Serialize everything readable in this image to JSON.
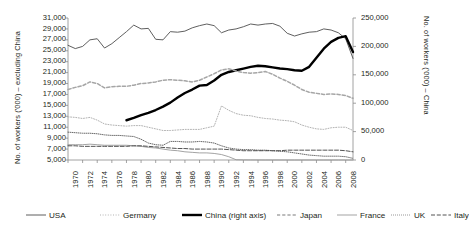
{
  "chart_data": {
    "type": "line",
    "title": "",
    "subtitle": "",
    "xlabel": "",
    "ylabel": "No. of workers ('000) – excluding China",
    "y2label": "No. of workers ('000) – China",
    "grid": false,
    "legend_position": "bottom",
    "x": [
      1970,
      1971,
      1972,
      1973,
      1974,
      1975,
      1976,
      1977,
      1978,
      1979,
      1980,
      1981,
      1982,
      1983,
      1984,
      1985,
      1986,
      1987,
      1988,
      1989,
      1990,
      1991,
      1992,
      1993,
      1994,
      1995,
      1996,
      1997,
      1998,
      1999,
      2000,
      2001,
      2002,
      2003,
      2004,
      2005,
      2006,
      2007,
      2008,
      2009
    ],
    "x_tick_labels": [
      "1970",
      "1972",
      "1974",
      "1976",
      "1978",
      "1980",
      "1982",
      "1984",
      "1986",
      "1988",
      "1990",
      "1992",
      "1994",
      "1996",
      "1998",
      "2000",
      "2002",
      "2004",
      "2006",
      "2008"
    ],
    "xlim": [
      1970,
      2009
    ],
    "ylim": [
      5000,
      31000
    ],
    "y_ticks": [
      5000,
      7000,
      9000,
      11000,
      13000,
      15000,
      17000,
      19000,
      21000,
      23000,
      25000,
      27000,
      29000,
      31000
    ],
    "y_tick_labels": [
      "5,000",
      "7,000",
      "9,000",
      "11,000",
      "13,000",
      "15,000",
      "17,000",
      "19,000",
      "21,000",
      "23,000",
      "25,000",
      "27,000",
      "29,000",
      "31,000"
    ],
    "y2lim": [
      0,
      250000
    ],
    "y2_ticks": [
      0,
      50000,
      100000,
      150000,
      200000,
      250000
    ],
    "y2_tick_labels": [
      "0",
      "50,000",
      "100,000",
      "150,000",
      "200,000",
      "250,000"
    ],
    "series": [
      {
        "name": "USA",
        "axis": "left",
        "style": "solid",
        "color": "#4d4d4d",
        "width": 0.9,
        "values": [
          26000,
          25400,
          25800,
          27000,
          27200,
          25500,
          26300,
          27400,
          28500,
          29700,
          29000,
          29100,
          27100,
          27000,
          28500,
          28400,
          28600,
          29200,
          29600,
          29900,
          29600,
          28300,
          28800,
          29000,
          29400,
          29900,
          29700,
          29900,
          30000,
          29500,
          28200,
          27700,
          28100,
          28400,
          28500,
          29000,
          28800,
          28300,
          27200,
          23600
        ]
      },
      {
        "name": "Germany",
        "axis": "left",
        "style": "dotted",
        "color": "#b3b3b3",
        "width": 1.0,
        "values": [
          12900,
          12800,
          12600,
          12800,
          12300,
          11600,
          11400,
          11300,
          11200,
          11300,
          11300,
          11000,
          10700,
          10400,
          10400,
          10500,
          10600,
          10600,
          10600,
          10900,
          11200,
          14900,
          14100,
          13500,
          13200,
          13100,
          12800,
          12600,
          12500,
          12300,
          12200,
          12000,
          11400,
          11000,
          10700,
          10600,
          10900,
          11000,
          11000,
          10400
        ]
      },
      {
        "name": "China (right axis)",
        "axis": "right",
        "style": "solid",
        "color": "#000000",
        "width": 2.4,
        "values": [
          null,
          null,
          null,
          null,
          null,
          null,
          null,
          null,
          70000,
          74000,
          79000,
          83000,
          88000,
          94000,
          101000,
          110000,
          118000,
          124000,
          131000,
          132000,
          140000,
          150000,
          155000,
          158000,
          161000,
          164000,
          166000,
          165000,
          163000,
          161000,
          160000,
          158000,
          157000,
          164000,
          180000,
          196000,
          208000,
          215000,
          218000,
          190000
        ]
      },
      {
        "name": "Japan",
        "axis": "left",
        "style": "dashed",
        "color": "#a6a6a6",
        "width": 1.5,
        "values": [
          17900,
          18300,
          18600,
          19300,
          19000,
          18200,
          18400,
          18500,
          18500,
          18700,
          19000,
          19100,
          19300,
          19600,
          19700,
          19600,
          19500,
          19300,
          19600,
          20200,
          20800,
          21500,
          21700,
          21300,
          21000,
          20900,
          21000,
          21200,
          20700,
          20000,
          19400,
          18700,
          17900,
          17400,
          17200,
          17000,
          17100,
          17000,
          16800,
          16300
        ]
      },
      {
        "name": "France",
        "axis": "left",
        "style": "solid",
        "color": "#999999",
        "width": 0.9,
        "values": [
          7800,
          7800,
          7800,
          7900,
          7800,
          7700,
          7700,
          7700,
          7700,
          7600,
          7500,
          7300,
          7200,
          7000,
          6800,
          6700,
          6500,
          6400,
          6300,
          6300,
          6200,
          6000,
          5600,
          5050,
          5020,
          5010,
          5005,
          5000,
          5000,
          5000,
          5000,
          5000,
          5000,
          5000,
          5000,
          5000,
          5000,
          5000,
          5000,
          5000
        ]
      },
      {
        "name": "UK",
        "axis": "left",
        "style": "fine-dotted",
        "color": "#595959",
        "width": 0.9,
        "values": [
          10100,
          10000,
          9900,
          9900,
          9800,
          9600,
          9500,
          9500,
          9400,
          9300,
          8800,
          8100,
          7800,
          7700,
          8400,
          8400,
          8300,
          8300,
          8400,
          8300,
          8100,
          7600,
          7200,
          7000,
          6900,
          6900,
          6800,
          6800,
          6700,
          6600,
          6500,
          6300,
          6100,
          5900,
          5800,
          5700,
          5700,
          5700,
          5600,
          5300
        ]
      },
      {
        "name": "Italy",
        "axis": "left",
        "style": "dash-long",
        "color": "#404040",
        "width": 0.9,
        "values": [
          7600,
          7600,
          7500,
          7500,
          7500,
          7500,
          7500,
          7500,
          7500,
          7600,
          7600,
          7500,
          7400,
          7300,
          7200,
          7100,
          7100,
          7000,
          7000,
          7000,
          7000,
          7000,
          6900,
          6800,
          6700,
          6700,
          6700,
          6700,
          6700,
          6700,
          6800,
          6800,
          6800,
          6800,
          6800,
          6800,
          6800,
          6800,
          6700,
          6500
        ]
      }
    ]
  },
  "legend": {
    "items": [
      {
        "label": "USA",
        "key": "USA"
      },
      {
        "label": "Germany",
        "key": "Germany"
      },
      {
        "label": "China (right axis)",
        "key": "China"
      },
      {
        "label": "Japan",
        "key": "Japan"
      },
      {
        "label": "France",
        "key": "France"
      },
      {
        "label": "UK",
        "key": "UK"
      },
      {
        "label": "Italy",
        "key": "Italy"
      }
    ]
  },
  "colors": {
    "axis": "#8c8c8c",
    "text": "#231f20",
    "background": "#ffffff"
  }
}
